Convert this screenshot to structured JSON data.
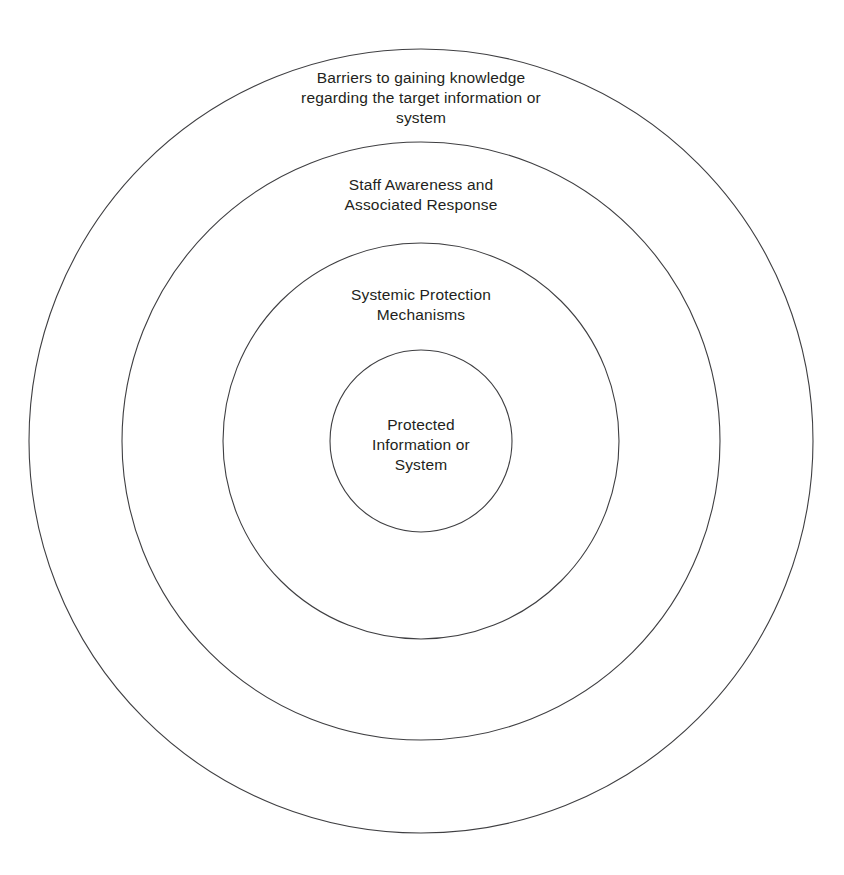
{
  "diagram": {
    "type": "concentric-circles",
    "title": "",
    "background_color": "#ffffff",
    "stroke_color": "#3f3f42",
    "text_color": "#231f20",
    "stroke_width": 1.1,
    "center": {
      "x": 421,
      "y": 441
    },
    "rings": [
      {
        "id": "outer",
        "order": 1,
        "radius": 392,
        "label": "Barriers to gaining knowledge\nregarding the target information or\nsystem",
        "label_lines": [
          "Barriers to gaining knowledge",
          "regarding the target information or",
          "system"
        ]
      },
      {
        "id": "second",
        "order": 2,
        "radius": 299,
        "label": "Staff Awareness and\nAssociated Response",
        "label_lines": [
          "Staff Awareness and",
          "Associated Response"
        ]
      },
      {
        "id": "third",
        "order": 3,
        "radius": 198,
        "label": "Systemic Protection\nMechanisms",
        "label_lines": [
          "Systemic Protection",
          "Mechanisms"
        ]
      },
      {
        "id": "inner",
        "order": 4,
        "radius": 91,
        "label": "Protected\nInformation or\nSystem",
        "label_lines": [
          "Protected",
          "Information or",
          "System"
        ]
      }
    ]
  }
}
